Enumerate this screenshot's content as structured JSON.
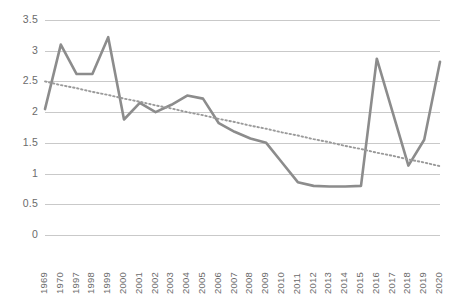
{
  "chart_data": {
    "type": "line",
    "title": "",
    "xlabel": "",
    "ylabel": "",
    "ylim": [
      0,
      3.5
    ],
    "ytick_step": 0.5,
    "grid": true,
    "legend": "none",
    "line_color": "#8c8c8c",
    "trend_color": "#9a9a9a",
    "gridline_color": "#c9c9c9",
    "tick_label_color": "#6b6b6b",
    "categories": [
      "1969",
      "1970",
      "1997",
      "1998",
      "1999",
      "2000",
      "2001",
      "2002",
      "2003",
      "2004",
      "2005",
      "2006",
      "2007",
      "2008",
      "2009",
      "2010",
      "2011",
      "2012",
      "2013",
      "2014",
      "2015",
      "2016",
      "2017",
      "2018",
      "2019",
      "2020"
    ],
    "ytick_labels": [
      "3.5",
      "3",
      "2.5",
      "2",
      "1.5",
      "1",
      "0.5",
      "0"
    ],
    "ytick_values": [
      3.5,
      3,
      2.5,
      2,
      1.5,
      1,
      0.5,
      0
    ],
    "series": [
      {
        "name": "value",
        "style": "solid",
        "values": [
          2.05,
          3.1,
          2.62,
          2.62,
          3.22,
          1.88,
          2.15,
          2.0,
          2.12,
          2.27,
          2.22,
          1.82,
          1.68,
          1.57,
          1.5,
          1.18,
          0.86,
          0.8,
          0.79,
          0.79,
          0.8,
          2.87,
          2.0,
          1.13,
          1.55,
          2.82
        ]
      },
      {
        "name": "linear-trendline",
        "style": "dotted",
        "values": [
          2.5,
          2.44,
          2.39,
          2.33,
          2.28,
          2.22,
          2.17,
          2.11,
          2.06,
          2.0,
          1.95,
          1.89,
          1.84,
          1.78,
          1.73,
          1.67,
          1.62,
          1.56,
          1.51,
          1.45,
          1.4,
          1.34,
          1.29,
          1.23,
          1.18,
          1.12
        ]
      }
    ]
  }
}
